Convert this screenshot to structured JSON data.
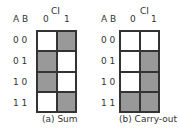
{
  "maps": [
    {
      "caption": "(a) Sum",
      "ci_label": "CI",
      "ab_label": "A B",
      "col_headers": [
        "0",
        "1"
      ],
      "row_labels": [
        "0 0",
        "0 1",
        "1 0",
        "1 1"
      ],
      "cells": [
        [
          0,
          1
        ],
        [
          1,
          0
        ],
        [
          1,
          0
        ],
        [
          0,
          1
        ]
      ]
    },
    {
      "caption": "(b) Carry-out",
      "ci_label": "CI",
      "ab_label": "A B",
      "col_headers": [
        "0",
        "1"
      ],
      "row_labels": [
        "0 0",
        "0 1",
        "1 0",
        "1 1"
      ],
      "cells": [
        [
          0,
          0
        ],
        [
          0,
          1
        ],
        [
          0,
          1
        ],
        [
          1,
          1
        ]
      ]
    }
  ],
  "colors": {
    "filled": "#999999",
    "empty": "#ffffff",
    "line": "#333333"
  }
}
